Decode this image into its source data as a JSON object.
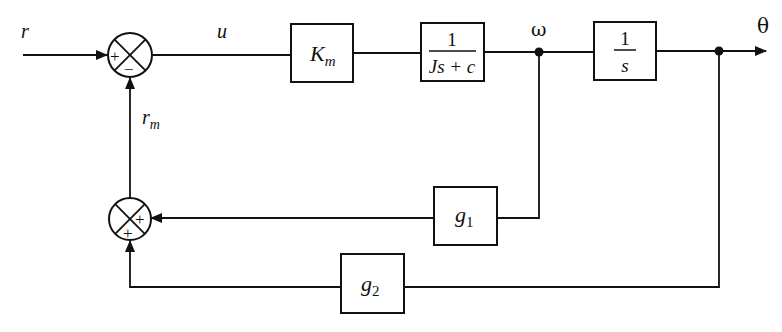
{
  "diagram": {
    "type": "block-diagram",
    "signals": {
      "input": "r",
      "control": "u",
      "feedback_sum": "r",
      "feedback_sum_sub": "m",
      "velocity": "ω",
      "output": "θ"
    },
    "summing_junctions": [
      {
        "id": "main-sum",
        "top_left_sign": "+",
        "bottom_sign": "−"
      },
      {
        "id": "feedback-sum",
        "right_sign": "+",
        "bottom_sign": "+"
      }
    ],
    "blocks": {
      "gain": {
        "main": "K",
        "sub": "m"
      },
      "plant": {
        "numerator": "1",
        "denominator": "Js + c"
      },
      "integrator": {
        "numerator": "1",
        "denominator": "s"
      },
      "g1": {
        "main": "g",
        "sub": "1"
      },
      "g2": {
        "main": "g",
        "sub": "2"
      }
    }
  }
}
